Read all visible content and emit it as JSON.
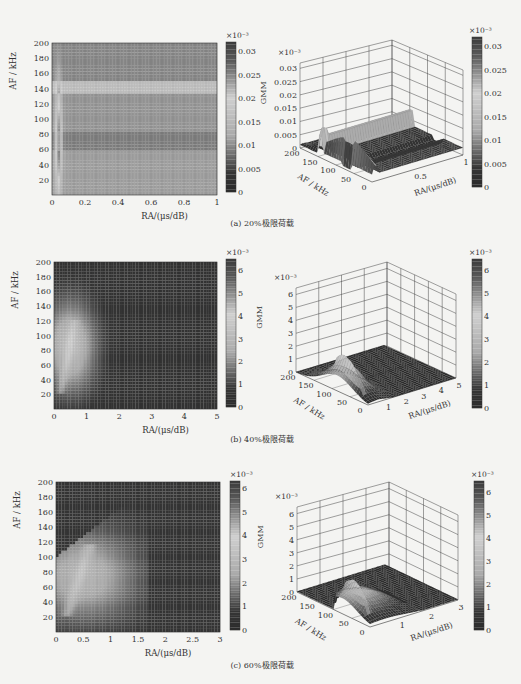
{
  "figure": {
    "colormap": "jet (rendered in grayscale)",
    "panels": [
      {
        "caption": "(a) 20%极限荷载",
        "heatmap": {
          "xlabel": "RA/(μs/dB)",
          "ylabel": "AF / kHz",
          "xticks": [
            "0",
            "0.2",
            "0.4",
            "0.6",
            "0.8",
            "1"
          ],
          "yticks": [
            "20",
            "40",
            "60",
            "80",
            "100",
            "120",
            "140",
            "160",
            "180",
            "200"
          ],
          "colorbar_exponent": "×10⁻³",
          "colorbar_ticks": [
            "0",
            "0.005",
            "0.01",
            "0.015",
            "0.02",
            "0.025",
            "0.03"
          ]
        },
        "surface": {
          "zlabel": "GMM",
          "z_exponent": "×10⁻³",
          "zticks": [
            "0",
            "0.005",
            "0.01",
            "0.015",
            "0.02",
            "0.025",
            "0.03"
          ],
          "af_ticks": [
            "200",
            "150",
            "100",
            "50",
            "0"
          ],
          "af_label": "AF / kHz",
          "ra_ticks": [
            "0.5",
            "1"
          ],
          "ra_label": "RA/(μs/dB)",
          "colorbar_exponent": "×10⁻³",
          "colorbar_ticks": [
            "0",
            "0.005",
            "0.01",
            "0.015",
            "0.02",
            "0.025",
            "0.03"
          ]
        }
      },
      {
        "caption": "(b) 40%极限荷载",
        "heatmap": {
          "xlabel": "RA/(μs/dB)",
          "ylabel": "AF / kHz",
          "xticks": [
            "0",
            "1",
            "2",
            "3",
            "4",
            "5"
          ],
          "yticks": [
            "20",
            "40",
            "60",
            "80",
            "100",
            "120",
            "140",
            "160",
            "180",
            "200"
          ],
          "colorbar_exponent": "×10⁻³",
          "colorbar_ticks": [
            "0",
            "1",
            "2",
            "3",
            "4",
            "5",
            "6"
          ]
        },
        "surface": {
          "zlabel": "GMM",
          "z_exponent": "×10⁻³",
          "zticks": [
            "0",
            "1",
            "2",
            "3",
            "4",
            "5",
            "6"
          ],
          "af_ticks": [
            "200",
            "150",
            "100",
            "50",
            "0"
          ],
          "af_label": "AF / kHz",
          "ra_ticks": [
            "1",
            "2",
            "3",
            "4",
            "5"
          ],
          "ra_label": "RA/(μs/dB)",
          "colorbar_exponent": "×10⁻³",
          "colorbar_ticks": [
            "0",
            "1",
            "2",
            "3",
            "4",
            "5",
            "6"
          ]
        }
      },
      {
        "caption": "(c) 60%极限荷载",
        "heatmap": {
          "xlabel": "RA/(μs/dB)",
          "ylabel": "AF / kHz",
          "xticks": [
            "0",
            "0.5",
            "1",
            "1.5",
            "2",
            "2.5",
            "3"
          ],
          "yticks": [
            "20",
            "40",
            "60",
            "80",
            "100",
            "120",
            "140",
            "160",
            "180",
            "200"
          ],
          "colorbar_exponent": "×10⁻³",
          "colorbar_ticks": [
            "0",
            "1",
            "2",
            "3",
            "4",
            "5",
            "6"
          ]
        },
        "surface": {
          "zlabel": "GMM",
          "z_exponent": "×10⁻³",
          "zticks": [
            "0",
            "1",
            "2",
            "3",
            "4",
            "5",
            "6"
          ],
          "af_ticks": [
            "200",
            "150",
            "100",
            "50",
            "0"
          ],
          "af_label": "AF / kHz",
          "ra_ticks": [
            "1",
            "2",
            "3"
          ],
          "ra_label": "RA/(μs/dB)",
          "colorbar_exponent": "×10⁻³",
          "colorbar_ticks": [
            "0",
            "1",
            "2",
            "3",
            "4",
            "5",
            "6"
          ]
        }
      }
    ]
  },
  "chart_data": [
    {
      "type": "heatmap",
      "title": "(a) 20%极限荷载 — GMM density (2D)",
      "xlabel": "RA/(μs/dB)",
      "ylabel": "AF / kHz",
      "xlim": [
        0,
        1
      ],
      "ylim": [
        0,
        200
      ],
      "zlim": [
        0,
        0.032
      ],
      "z_scale": "×10⁻³",
      "description": "Bright narrow ridge near RA≈0.02–0.06 across AF 0–140 kHz, peak near AF≈60 kHz; horizontal bands: light band at AF≈140–150, darker bands at AF≈60–80 and 160–200."
    },
    {
      "type": "surface",
      "title": "(a) 20%极限荷载 — GMM surface (3D)",
      "xlabel": "AF / kHz",
      "ylabel": "RA/(μs/dB)",
      "zlabel": "GMM",
      "xlim": [
        0,
        200
      ],
      "ylim": [
        0,
        1
      ],
      "zlim": [
        0,
        0.03
      ],
      "z_scale": "×10⁻³",
      "peak": {
        "AF": 60,
        "RA": 0.04,
        "GMM": 0.021
      }
    },
    {
      "type": "heatmap",
      "title": "(b) 40%极限荷载 — GMM density (2D)",
      "xlabel": "RA/(μs/dB)",
      "ylabel": "AF / kHz",
      "xlim": [
        0,
        5
      ],
      "ylim": [
        0,
        200
      ],
      "zlim": [
        0,
        6.5
      ],
      "z_scale": "×10⁻³",
      "description": "Crescent-shaped high region from RA 0–1.6, AF 20–140 kHz; brightest arc near RA≈0.4–0.6, AF≈40–110 kHz."
    },
    {
      "type": "surface",
      "title": "(b) 40%极限荷载 — GMM surface (3D)",
      "xlabel": "AF / kHz",
      "ylabel": "RA/(μs/dB)",
      "zlabel": "GMM",
      "xlim": [
        0,
        200
      ],
      "ylim": [
        0,
        5
      ],
      "zlim": [
        0,
        6.5
      ],
      "z_scale": "×10⁻³",
      "peak": {
        "AF": 100,
        "RA": 0.5,
        "GMM": 4.2
      }
    },
    {
      "type": "heatmap",
      "title": "(c) 60%极限荷载 — GMM density (2D)",
      "xlabel": "RA/(μs/dB)",
      "ylabel": "AF / kHz",
      "xlim": [
        0,
        3
      ],
      "ylim": [
        0,
        200
      ],
      "zlim": [
        0,
        6.3
      ],
      "z_scale": "×10⁻³",
      "description": "Wedge-shaped high region from RA 0–1.6, AF 0–130 kHz; brightest arc near RA≈0.4–0.6, AF≈40–110 kHz."
    },
    {
      "type": "surface",
      "title": "(c) 60%极限荷载 — GMM surface (3D)",
      "xlabel": "AF / kHz",
      "ylabel": "RA/(μs/dB)",
      "zlabel": "GMM",
      "xlim": [
        0,
        200
      ],
      "ylim": [
        0,
        3
      ],
      "zlim": [
        0,
        6.3
      ],
      "z_scale": "×10⁻³",
      "peak": {
        "AF": 100,
        "RA": 0.5,
        "GMM": 4.3
      }
    }
  ]
}
